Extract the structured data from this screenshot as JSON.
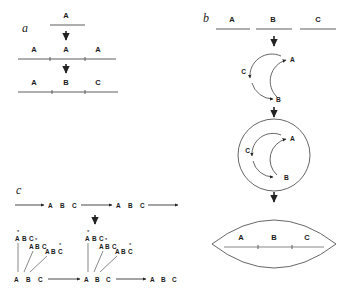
{
  "figure": {
    "background_color": "#ffffff",
    "line_color": "#5c5c5c",
    "text_color": "#1a1a1a"
  },
  "panels": {
    "a": {
      "letter": "a",
      "rows": [
        {
          "id": "a-row1",
          "labels": [
            "A"
          ],
          "segments": 1,
          "description": "single segment A"
        },
        {
          "id": "a-row2",
          "labels": [
            "A",
            "A",
            "A"
          ],
          "segments": 3,
          "description": "three identical A segments"
        },
        {
          "id": "a-row3",
          "labels": [
            "A",
            "B",
            "C"
          ],
          "segments": 3,
          "description": "diverged segments A B C"
        }
      ],
      "arrows": [
        "down",
        "down"
      ]
    },
    "b": {
      "letter": "b",
      "top_segments": [
        {
          "label": "A"
        },
        {
          "label": "B"
        },
        {
          "label": "C"
        }
      ],
      "circle_single": {
        "labels": [
          "A",
          "B",
          "C"
        ],
        "description": "circular arrangement with three arcs"
      },
      "circle_double": {
        "labels": [
          "A",
          "B",
          "C"
        ],
        "description": "double concentric circle"
      },
      "lens": {
        "labels": [
          "A",
          "B",
          "C"
        ],
        "description": "lens shaped form with linear A B C axis"
      },
      "arrows": [
        "down",
        "down",
        "down"
      ]
    },
    "c": {
      "letter": "c",
      "top_row": {
        "units": [
          {
            "labels": [
              "A",
              "B",
              "C"
            ]
          },
          {
            "labels": [
              "A",
              "B",
              "C"
            ]
          }
        ],
        "description": "tandem repeats of A B C"
      },
      "arrow": "down",
      "clusters": [
        {
          "id": "cluster-1",
          "copies": [
            {
              "labels": [
                "A",
                "B",
                "C"
              ],
              "asterisk_on": "A"
            },
            {
              "labels": [
                "A",
                "B",
                "C"
              ],
              "asterisk_on": "B"
            },
            {
              "labels": [
                "A",
                "B",
                "C"
              ],
              "asterisk_on": "C"
            }
          ]
        },
        {
          "id": "cluster-2",
          "copies": [
            {
              "labels": [
                "A",
                "B",
                "C"
              ],
              "asterisk_on": "A"
            },
            {
              "labels": [
                "A",
                "B",
                "C"
              ],
              "asterisk_on": "B"
            },
            {
              "labels": [
                "A",
                "B",
                "C"
              ],
              "asterisk_on": "C"
            }
          ]
        }
      ],
      "bottom_row": {
        "units": [
          {
            "labels": [
              "A",
              "B",
              "C"
            ]
          },
          {
            "labels": [
              "A",
              "B",
              "C"
            ]
          },
          {
            "labels": [
              "A",
              "B",
              "C"
            ]
          }
        ]
      }
    }
  },
  "glyphs": {
    "asterisk": "*",
    "letter_a": "A",
    "letter_b": "B",
    "letter_c": "C"
  }
}
